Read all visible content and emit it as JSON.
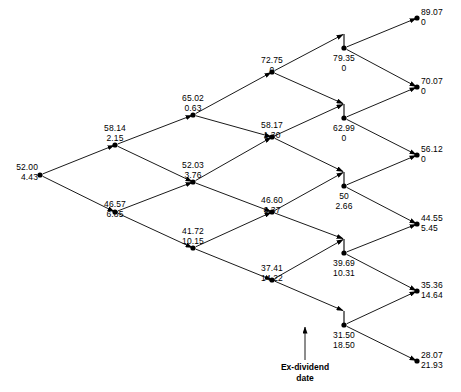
{
  "diagram": {
    "annotation": {
      "line1": "Ex-dividend",
      "line2": "date"
    },
    "colors": {
      "stroke": "#000000",
      "node": "#000000",
      "text": "#000000"
    },
    "nodes": [
      {
        "id": "n0",
        "col": 0,
        "price": "52.00",
        "option": "4.43",
        "x": 40,
        "y": 175,
        "label_x": 38,
        "label_y": 162,
        "label_align": "right",
        "dividend_drop": 0
      },
      {
        "id": "n1u",
        "col": 1,
        "price": "58.14",
        "option": "2.15",
        "x": 115,
        "y": 145,
        "label_x": 115,
        "label_y": 123,
        "label_align": "center",
        "dividend_drop": 0
      },
      {
        "id": "n1d",
        "col": 1,
        "price": "46.57",
        "option": "6.85",
        "x": 115,
        "y": 212,
        "label_x": 115,
        "label_y": 199,
        "label_align": "center",
        "dividend_drop": 0
      },
      {
        "id": "n2u",
        "col": 2,
        "price": "65.02",
        "option": "0.63",
        "x": 193,
        "y": 115,
        "label_x": 193,
        "label_y": 93,
        "label_align": "center",
        "dividend_drop": 0
      },
      {
        "id": "n2m",
        "col": 2,
        "price": "52.03",
        "option": "3.76",
        "x": 193,
        "y": 182,
        "label_x": 193,
        "label_y": 160,
        "label_align": "center",
        "dividend_drop": 0
      },
      {
        "id": "n2d",
        "col": 2,
        "price": "41.72",
        "option": "10.15",
        "x": 193,
        "y": 248,
        "label_x": 193,
        "label_y": 226,
        "label_align": "center",
        "dividend_drop": 0
      },
      {
        "id": "n3u",
        "col": 3,
        "price": "72.75",
        "option": "0",
        "x": 272,
        "y": 72,
        "label_x": 272,
        "label_y": 55,
        "label_align": "center",
        "dividend_drop": 0
      },
      {
        "id": "n3a",
        "col": 3,
        "price": "58.17",
        "option": "1.30",
        "x": 272,
        "y": 137,
        "label_x": 272,
        "label_y": 120,
        "label_align": "center",
        "dividend_drop": 0
      },
      {
        "id": "n3b",
        "col": 3,
        "price": "46.60",
        "option": "6.37",
        "x": 272,
        "y": 212,
        "label_x": 272,
        "label_y": 195,
        "label_align": "center",
        "dividend_drop": 0
      },
      {
        "id": "n3d",
        "col": 3,
        "price": "37.41",
        "option": "14.22",
        "x": 272,
        "y": 280,
        "label_x": 272,
        "label_y": 263,
        "label_align": "center",
        "dividend_drop": 0
      },
      {
        "id": "n4u",
        "col": 4,
        "price": "79.35",
        "option": "0",
        "x": 344,
        "y": 48,
        "label_x": 344,
        "label_y": 53,
        "label_align": "center",
        "dividend_drop": 14
      },
      {
        "id": "n4a",
        "col": 4,
        "price": "62.99",
        "option": "0",
        "x": 344,
        "y": 118,
        "label_x": 344,
        "label_y": 123,
        "label_align": "center",
        "dividend_drop": 14
      },
      {
        "id": "n4b",
        "col": 4,
        "price": "50",
        "option": "2.66",
        "x": 344,
        "y": 186,
        "label_x": 344,
        "label_y": 191,
        "label_align": "center",
        "dividend_drop": 14
      },
      {
        "id": "n4c",
        "col": 4,
        "price": "39.69",
        "option": "10.31",
        "x": 344,
        "y": 253,
        "label_x": 344,
        "label_y": 258,
        "label_align": "center",
        "dividend_drop": 14
      },
      {
        "id": "n4d",
        "col": 4,
        "price": "31.50",
        "option": "18.50",
        "x": 344,
        "y": 325,
        "label_x": 344,
        "label_y": 330,
        "label_align": "center",
        "dividend_drop": 14
      },
      {
        "id": "n5a",
        "col": 5,
        "price": "89.07",
        "option": "0",
        "x": 417,
        "y": 18,
        "label_x": 421,
        "label_y": 7,
        "label_align": "left",
        "dividend_drop": 0
      },
      {
        "id": "n5b",
        "col": 5,
        "price": "70.07",
        "option": "0",
        "x": 417,
        "y": 87,
        "label_x": 421,
        "label_y": 76,
        "label_align": "left",
        "dividend_drop": 0
      },
      {
        "id": "n5c",
        "col": 5,
        "price": "56.12",
        "option": "0",
        "x": 417,
        "y": 155,
        "label_x": 421,
        "label_y": 144,
        "label_align": "left",
        "dividend_drop": 0
      },
      {
        "id": "n5d",
        "col": 5,
        "price": "44.55",
        "option": "5.45",
        "x": 417,
        "y": 224,
        "label_x": 421,
        "label_y": 213,
        "label_align": "left",
        "dividend_drop": 0
      },
      {
        "id": "n5e",
        "col": 5,
        "price": "35.36",
        "option": "14.64",
        "x": 417,
        "y": 291,
        "label_x": 421,
        "label_y": 280,
        "label_align": "left",
        "dividend_drop": 0
      },
      {
        "id": "n5f",
        "col": 5,
        "price": "28.07",
        "option": "21.93",
        "x": 417,
        "y": 361,
        "label_x": 421,
        "label_y": 350,
        "label_align": "left",
        "dividend_drop": 0
      }
    ],
    "edges": [
      {
        "from": "n0",
        "to": "n1u"
      },
      {
        "from": "n0",
        "to": "n1d"
      },
      {
        "from": "n1u",
        "to": "n2u"
      },
      {
        "from": "n1u",
        "to": "n2m"
      },
      {
        "from": "n1d",
        "to": "n2m"
      },
      {
        "from": "n1d",
        "to": "n2d"
      },
      {
        "from": "n2u",
        "to": "n3u"
      },
      {
        "from": "n2u",
        "to": "n3a"
      },
      {
        "from": "n2m",
        "to": "n3a"
      },
      {
        "from": "n2m",
        "to": "n3b"
      },
      {
        "from": "n2d",
        "to": "n3b"
      },
      {
        "from": "n2d",
        "to": "n3d"
      },
      {
        "from": "n3u",
        "to": "n4u"
      },
      {
        "from": "n3u",
        "to": "n4a"
      },
      {
        "from": "n3a",
        "to": "n4a"
      },
      {
        "from": "n3a",
        "to": "n4b"
      },
      {
        "from": "n3b",
        "to": "n4b"
      },
      {
        "from": "n3b",
        "to": "n4c"
      },
      {
        "from": "n3d",
        "to": "n4c"
      },
      {
        "from": "n3d",
        "to": "n4d"
      },
      {
        "from": "n4u",
        "to": "n5a"
      },
      {
        "from": "n4u",
        "to": "n5b"
      },
      {
        "from": "n4a",
        "to": "n5b"
      },
      {
        "from": "n4a",
        "to": "n5c"
      },
      {
        "from": "n4b",
        "to": "n5c"
      },
      {
        "from": "n4b",
        "to": "n5d"
      },
      {
        "from": "n4c",
        "to": "n5d"
      },
      {
        "from": "n4c",
        "to": "n5e"
      },
      {
        "from": "n4d",
        "to": "n5e"
      },
      {
        "from": "n4d",
        "to": "n5f"
      }
    ],
    "callout": {
      "x": 305,
      "y": 327,
      "arrow_top_y": 327,
      "arrow_bottom_y": 360,
      "text_y": 362
    }
  },
  "chart_data": {
    "type": "diagram",
    "steps": 5,
    "columns": [
      {
        "index": 0,
        "prices": [
          "52.00"
        ],
        "options": [
          "4.43"
        ]
      },
      {
        "index": 1,
        "prices": [
          "58.14",
          "46.57"
        ],
        "options": [
          "2.15",
          "6.85"
        ]
      },
      {
        "index": 2,
        "prices": [
          "65.02",
          "52.03",
          "41.72"
        ],
        "options": [
          "0.63",
          "3.76",
          "10.15"
        ]
      },
      {
        "index": 3,
        "prices": [
          "72.75",
          "58.17",
          "46.60",
          "37.41"
        ],
        "options": [
          "0",
          "1.30",
          "6.37",
          "14.22"
        ]
      },
      {
        "index": 4,
        "prices": [
          "79.35",
          "62.99",
          "50",
          "39.69",
          "31.50"
        ],
        "options": [
          "0",
          "0",
          "2.66",
          "10.31",
          "18.50"
        ]
      },
      {
        "index": 5,
        "prices": [
          "89.07",
          "70.07",
          "56.12",
          "44.55",
          "35.36",
          "28.07"
        ],
        "options": [
          "0",
          "0",
          "0",
          "5.45",
          "14.64",
          "21.93"
        ]
      }
    ],
    "ex_dividend_column": 4,
    "annotation": "Ex-dividend date"
  }
}
